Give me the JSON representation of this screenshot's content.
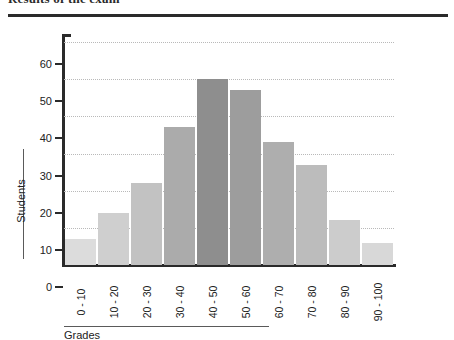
{
  "document": {
    "title": "Results of the exam",
    "title_clipped": true
  },
  "chart_data": {
    "type": "bar",
    "title": "Results of the exam",
    "xlabel": "Grades",
    "ylabel": "Students",
    "categories": [
      "0 - 10",
      "10 - 20",
      "20 - 30",
      "30 - 40",
      "40 - 50",
      "50 - 60",
      "60 - 70",
      "70 - 80",
      "80 - 90",
      "90 - 100"
    ],
    "values": [
      7,
      14,
      22,
      37,
      50,
      47,
      33,
      27,
      12,
      6
    ],
    "bar_colors": [
      "#dcdcdc",
      "#cfcfcf",
      "#c2c2c2",
      "#ababab",
      "#8e8e8e",
      "#9d9d9d",
      "#aeaeae",
      "#bcbcbc",
      "#cccccc",
      "#d8d8d8"
    ],
    "ylim": [
      0,
      60
    ],
    "yticks": [
      0,
      10,
      20,
      30,
      40,
      50,
      60
    ],
    "ytick_labels": [
      "0",
      "10",
      "20",
      "30",
      "40",
      "50",
      "60"
    ],
    "grid": true,
    "grid_style": "dotted",
    "grid_axis": "y",
    "legend": false,
    "xtick_rotation": -90,
    "axis_color": "#2a2a2a",
    "grid_color": "#b9b9b9"
  }
}
